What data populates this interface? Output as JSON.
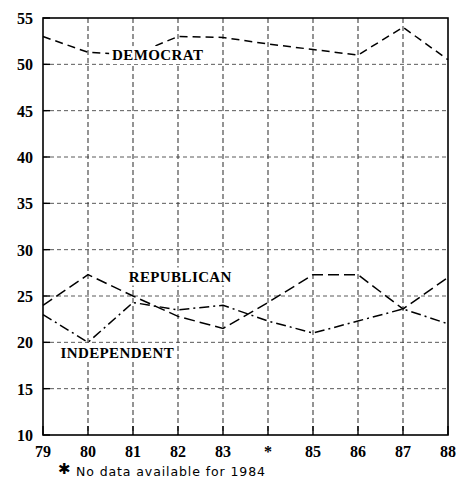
{
  "chart_data": {
    "type": "line",
    "title": "",
    "xlabel": "",
    "ylabel": "",
    "xlim": [
      0,
      9
    ],
    "ylim": [
      10,
      55
    ],
    "ytick_values": [
      10,
      15,
      20,
      25,
      30,
      35,
      40,
      45,
      50,
      55
    ],
    "ytick_labels": [
      "10",
      "15",
      "20",
      "25",
      "30",
      "35",
      "40",
      "45",
      "50",
      "55"
    ],
    "categories": [
      "79",
      "80",
      "81",
      "82",
      "83",
      "*",
      "85",
      "86",
      "87",
      "88"
    ],
    "grid": true,
    "legend_position": "inline-annotations",
    "series": [
      {
        "name": "DEMOCRAT",
        "style": "dashed",
        "values": [
          53.0,
          51.3,
          51.0,
          53.0,
          52.9,
          52.2,
          51.6,
          51.0,
          54.0,
          50.5
        ],
        "label_x_index": 2.55,
        "label_y": 51.0
      },
      {
        "name": "REPUBLICAN",
        "style": "long-dashed",
        "values": [
          24.0,
          27.3,
          25.0,
          22.8,
          21.5,
          24.3,
          27.3,
          27.3,
          23.6,
          27.0
        ],
        "label_x_index": 3.05,
        "label_y": 27.1
      },
      {
        "name": "INDEPENDENT",
        "style": "dash-dot",
        "values": [
          23.0,
          20.0,
          24.3,
          23.5,
          24.0,
          22.3,
          21.0,
          22.3,
          23.6,
          22.0
        ],
        "label_x_index": 1.65,
        "label_y": 18.9
      }
    ],
    "annotations": [
      {
        "name": "no-data-footnote",
        "symbol": "✱",
        "text": "No  data  available  for  1984"
      }
    ]
  }
}
